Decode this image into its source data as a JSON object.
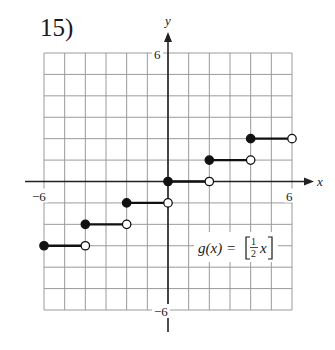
{
  "problem_number": "15)",
  "chart_data": {
    "type": "line",
    "title": "",
    "function_label": "g(x) = [½ x]",
    "function_label_parts": {
      "prefix": "g(x) = ",
      "num": "1",
      "den": "2",
      "var": "x"
    },
    "xlabel": "x",
    "ylabel": "y",
    "xlim": [
      -6,
      6
    ],
    "ylim": [
      -6,
      6
    ],
    "grid": true,
    "grid_step": 1,
    "tick_labels": {
      "x_min": "−6",
      "x_max": "6",
      "y_max": "6",
      "y_min": "−6"
    },
    "series": [
      {
        "name": "g(x) = floor(x/2)",
        "segments": [
          {
            "x0": -6,
            "x1": -4,
            "y": -3,
            "start": "closed",
            "end": "open"
          },
          {
            "x0": -4,
            "x1": -2,
            "y": -2,
            "start": "closed",
            "end": "open"
          },
          {
            "x0": -2,
            "x1": 0,
            "y": -1,
            "start": "closed",
            "end": "open"
          },
          {
            "x0": 0,
            "x1": 2,
            "y": 0,
            "start": "closed",
            "end": "open"
          },
          {
            "x0": 2,
            "x1": 4,
            "y": 1,
            "start": "closed",
            "end": "open"
          },
          {
            "x0": 4,
            "x1": 6,
            "y": 2,
            "start": "closed",
            "end": "open"
          }
        ]
      }
    ]
  },
  "colors": {
    "grid": "#9a9a9a",
    "axis": "#222222",
    "curve": "#111111",
    "text": "#1a1a1a"
  }
}
